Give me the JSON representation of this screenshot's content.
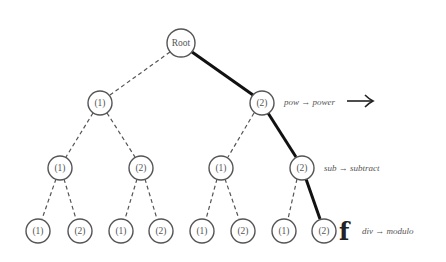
{
  "diagram": {
    "root": {
      "label": "Root",
      "x": 181,
      "y": 43
    },
    "level1": [
      {
        "label": "(1)",
        "x": 100,
        "y": 103
      },
      {
        "label": "(2)",
        "x": 262,
        "y": 103
      }
    ],
    "level2": [
      {
        "label": "(1)",
        "x": 60,
        "y": 168
      },
      {
        "label": "(2)",
        "x": 141,
        "y": 168
      },
      {
        "label": "(1)",
        "x": 221,
        "y": 168
      },
      {
        "label": "(2)",
        "x": 302,
        "y": 168
      }
    ],
    "level3": [
      {
        "label": "(1)",
        "x": 38,
        "y": 231
      },
      {
        "label": "(2)",
        "x": 80,
        "y": 231
      },
      {
        "label": "(1)",
        "x": 121,
        "y": 231
      },
      {
        "label": "(2)",
        "x": 161,
        "y": 231
      },
      {
        "label": "(1)",
        "x": 202,
        "y": 231
      },
      {
        "label": "(2)",
        "x": 243,
        "y": 231
      },
      {
        "label": "(1)",
        "x": 284,
        "y": 231
      },
      {
        "label": "(2)",
        "x": 324,
        "y": 231
      }
    ],
    "highlighted_path": [
      "Root",
      "(2)",
      "(2)",
      "(2)"
    ],
    "annotations": [
      {
        "text": "pow → power",
        "level": 1
      },
      {
        "text": "sub → subtract",
        "level": 2
      },
      {
        "text": "div → modulo",
        "level": 3
      }
    ],
    "arrow_glyph": "⟶",
    "final_marker": "f"
  }
}
